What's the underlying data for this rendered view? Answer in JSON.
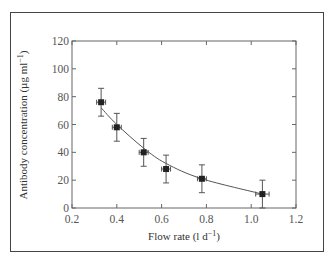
{
  "chart_data": {
    "type": "scatter",
    "title": "",
    "xlabel": "Flow rate (l d⁻¹)",
    "ylabel": "Antibody concentration (µg ml⁻¹)",
    "xlim": [
      0.2,
      1.2
    ],
    "ylim": [
      0,
      120
    ],
    "xticks": [
      "0.2",
      "0.4",
      "0.6",
      "0.8",
      "1.0",
      "1.2"
    ],
    "yticks": [
      "0",
      "20",
      "40",
      "60",
      "80",
      "100",
      "120"
    ],
    "grid": false,
    "legend": null,
    "series": [
      {
        "name": "measured",
        "marker": "square",
        "points": [
          {
            "x": 0.33,
            "y": 76,
            "yerr": 10,
            "xerr": 0.02
          },
          {
            "x": 0.4,
            "y": 58,
            "yerr": 10,
            "xerr": 0.02
          },
          {
            "x": 0.52,
            "y": 40,
            "yerr": 10,
            "xerr": 0.02
          },
          {
            "x": 0.62,
            "y": 28,
            "yerr": 10,
            "xerr": 0.02
          },
          {
            "x": 0.78,
            "y": 21,
            "yerr": 10,
            "xerr": 0.02
          },
          {
            "x": 1.05,
            "y": 10,
            "yerr": 10,
            "xerr": 0.03
          }
        ]
      },
      {
        "name": "fitted curve",
        "type": "line",
        "x": [
          0.33,
          0.4,
          0.52,
          0.62,
          0.78,
          1.05
        ],
        "y": [
          72,
          60,
          43,
          32,
          21,
          10
        ]
      }
    ]
  },
  "labels": {
    "xlabel_main": "Flow rate (l d",
    "xlabel_sup": "−1",
    "xlabel_end": ")",
    "ylabel_main": "Antibody concentration (µg ml",
    "ylabel_sup": "−1",
    "ylabel_end": ")"
  }
}
